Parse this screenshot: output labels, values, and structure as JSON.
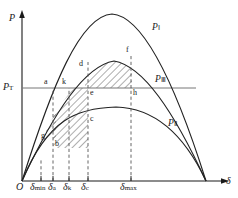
{
  "figure": {
    "title_axes": {
      "y_axis_label": "P",
      "x_axis_label": "δ",
      "origin_label": "O"
    },
    "threshold": {
      "label_main": "P",
      "label_sub": "T",
      "value_y_px": 88
    },
    "curves": [
      {
        "id": "P1",
        "label_main": "P",
        "label_sub": "Ⅰ",
        "peak_px": [
          112,
          14
        ],
        "label_px": [
          154,
          28
        ]
      },
      {
        "id": "P3",
        "label_main": "P",
        "label_sub": "Ⅲ",
        "peak_px": [
          114,
          61
        ],
        "label_px": [
          157,
          80
        ]
      },
      {
        "id": "P2",
        "label_main": "P",
        "label_sub": "Ⅱ",
        "peak_px": [
          116,
          107
        ],
        "label_px": [
          170,
          124
        ]
      }
    ],
    "x_ticks": [
      {
        "id": "dmin",
        "main": "δ",
        "sub": "min",
        "x_px": 41
      },
      {
        "id": "da",
        "main": "δ",
        "sub": "a",
        "x_px": 54
      },
      {
        "id": "dk",
        "main": "δ",
        "sub": "k",
        "x_px": 69
      },
      {
        "id": "dc",
        "main": "δ",
        "sub": "c",
        "x_px": 85
      },
      {
        "id": "dmax",
        "main": "δ",
        "sub": "max",
        "x_px": 128
      }
    ],
    "points": [
      {
        "id": "a",
        "label": "a",
        "x_px": 46,
        "y_px": 82
      },
      {
        "id": "k",
        "label": "k",
        "x_px": 63,
        "y_px": 82
      },
      {
        "id": "d",
        "label": "d",
        "x_px": 80,
        "y_px": 64
      },
      {
        "id": "e",
        "label": "e",
        "x_px": 88,
        "y_px": 90
      },
      {
        "id": "f",
        "label": "f",
        "x_px": 127,
        "y_px": 49
      },
      {
        "id": "h",
        "label": "h",
        "x_px": 132,
        "y_px": 90
      },
      {
        "id": "c",
        "label": "c",
        "x_px": 88,
        "y_px": 110
      },
      {
        "id": "g",
        "label": "g",
        "x_px": 42,
        "y_px": 124
      },
      {
        "id": "b",
        "label": "b",
        "x_px": 56,
        "y_px": 133
      }
    ],
    "colors": {
      "ink": "#1a1a1a",
      "curve": "#222222",
      "dashed": "#555555",
      "hatch": "#333333",
      "background": "#ffffff"
    },
    "hatched_areas": [
      {
        "id": "accel-area",
        "name": "abke acceleration area"
      },
      {
        "id": "decel-area",
        "name": "defh deceleration area"
      }
    ]
  }
}
